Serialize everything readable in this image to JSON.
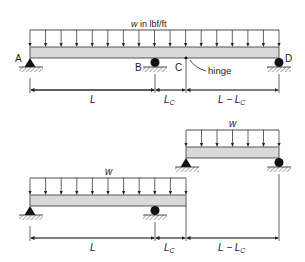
{
  "top": {
    "load_label_var": "w",
    "load_label_unit": " in lbf/ft",
    "point_a": "A",
    "point_b": "B",
    "point_c": "C",
    "point_d": "D",
    "hinge_label": "hinge",
    "dim_l": "L",
    "dim_lc": "L",
    "dim_lc_sub": "C",
    "dim_rest": "L − L",
    "dim_rest_sub": "C"
  },
  "bottom": {
    "right_load_label": "w",
    "left_load_label": "w",
    "dim_l": "L",
    "dim_lc": "L",
    "dim_lc_sub": "C",
    "dim_rest": "L − L",
    "dim_rest_sub": "C"
  },
  "colors": {
    "beam_fill": "#d9d9d9",
    "line": "#222222"
  }
}
